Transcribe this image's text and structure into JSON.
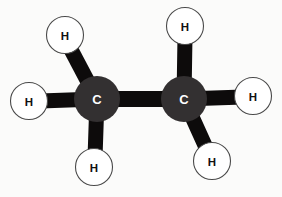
{
  "figure": {
    "name": "ethane-ball-and-stick-diagram",
    "background_color": "#fbfbfa",
    "bond_color": "#0d0b0b",
    "carbon_fill": "#333031",
    "carbon_label_color": "#ffffff",
    "hydrogen_fill": "#ffffff",
    "hydrogen_stroke": "#4a4a4a",
    "hydrogen_label_color": "#111111"
  },
  "atoms": [
    {
      "id": "carbon-left",
      "element": "C",
      "label": "C",
      "cx": 97,
      "cy": 99,
      "r": 23,
      "kind": "carbon"
    },
    {
      "id": "carbon-right",
      "element": "C",
      "label": "C",
      "cx": 184,
      "cy": 99,
      "r": 23,
      "kind": "carbon"
    },
    {
      "id": "hydrogen-top-left",
      "element": "H",
      "label": "H",
      "cx": 65,
      "cy": 35,
      "r": 18.5,
      "kind": "hydrogen"
    },
    {
      "id": "hydrogen-left",
      "element": "H",
      "label": "H",
      "cx": 29,
      "cy": 101,
      "r": 18.5,
      "kind": "hydrogen"
    },
    {
      "id": "hydrogen-bottom-left",
      "element": "H",
      "label": "H",
      "cx": 94,
      "cy": 167,
      "r": 18.5,
      "kind": "hydrogen"
    },
    {
      "id": "hydrogen-top-right",
      "element": "H",
      "label": "H",
      "cx": 185,
      "cy": 26,
      "r": 18.5,
      "kind": "hydrogen"
    },
    {
      "id": "hydrogen-right",
      "element": "H",
      "label": "H",
      "cx": 253,
      "cy": 96,
      "r": 18.5,
      "kind": "hydrogen"
    },
    {
      "id": "hydrogen-bottom-right",
      "element": "H",
      "label": "H",
      "cx": 212,
      "cy": 161,
      "r": 18.5,
      "kind": "hydrogen"
    }
  ],
  "bonds": [
    {
      "id": "bond-c-c",
      "from": "carbon-left",
      "to": "carbon-right",
      "x1": 97,
      "y1": 99,
      "x2": 184,
      "y2": 99,
      "width": 16
    },
    {
      "id": "bond-cl-h-topleft",
      "from": "carbon-left",
      "to": "hydrogen-top-left",
      "x1": 97,
      "y1": 99,
      "x2": 68,
      "y2": 44,
      "width": 15
    },
    {
      "id": "bond-cl-h-left",
      "from": "carbon-left",
      "to": "hydrogen-left",
      "x1": 97,
      "y1": 99,
      "x2": 40,
      "y2": 101,
      "width": 15
    },
    {
      "id": "bond-cl-h-bottomleft",
      "from": "carbon-left",
      "to": "hydrogen-bottom-left",
      "x1": 97,
      "y1": 99,
      "x2": 95,
      "y2": 158,
      "width": 15
    },
    {
      "id": "bond-cr-h-topright",
      "from": "carbon-right",
      "to": "hydrogen-top-right",
      "x1": 184,
      "y1": 99,
      "x2": 185,
      "y2": 36,
      "width": 15
    },
    {
      "id": "bond-cr-h-right",
      "from": "carbon-right",
      "to": "hydrogen-right",
      "x1": 184,
      "y1": 99,
      "x2": 243,
      "y2": 97,
      "width": 15
    },
    {
      "id": "bond-cr-h-bottomright",
      "from": "carbon-right",
      "to": "hydrogen-bottom-right",
      "x1": 184,
      "y1": 99,
      "x2": 208,
      "y2": 152,
      "width": 15
    }
  ],
  "chart_data": {
    "type": "diagram",
    "title": "",
    "molecule": "ethane",
    "formula": "C2H6",
    "carbon_count": 2,
    "hydrogen_count": 6,
    "bond_count": 7,
    "labels": [
      "H",
      "H",
      "C",
      "H",
      "H",
      "C",
      "H",
      "H"
    ]
  }
}
